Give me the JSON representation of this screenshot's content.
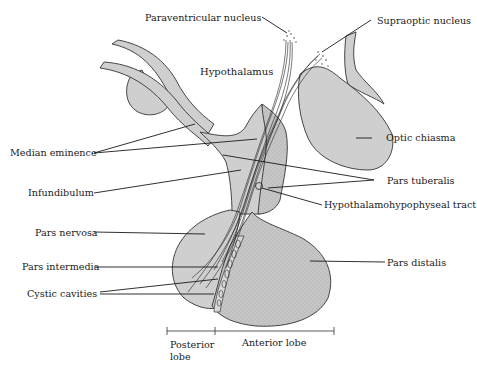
{
  "figure": {
    "labels": {
      "paraventricular_nucleus": "Paraventricular nucleus",
      "supraoptic_nucleus": "Supraoptic nucleus",
      "hypothalamus": "Hypothalamus",
      "optic_chiasma": "Optic chiasma",
      "median_eminence": "Median eminence",
      "pars_tuberalis": "Pars tuberalis",
      "infundibulum": "Infundibulum",
      "hypothalamohypophyseal_tract": "Hypothalamohypophyseal tract",
      "pars_nervosa": "Pars nervosa",
      "pars_distalis": "Pars distalis",
      "pars_intermedia": "Pars intermedia",
      "cystic_cavities": "Cystic cavities"
    },
    "scale_bar": {
      "posterior_line1": "Posterior",
      "posterior_line2": "lobe",
      "anterior": "Anterior lobe"
    },
    "colors": {
      "tissue_light": "#cfcfcf",
      "tissue_stippled": "#bdbdbd",
      "ink": "#1a1a1a",
      "background": "#ffffff"
    }
  }
}
